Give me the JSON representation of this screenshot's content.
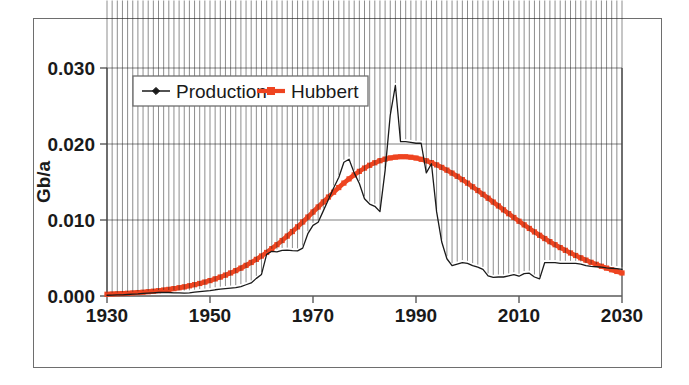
{
  "chart_data": {
    "type": "line",
    "title": "",
    "xlabel": "",
    "ylabel": "Gb/a",
    "xlim": [
      1930,
      2030
    ],
    "ylim": [
      0.0,
      0.03
    ],
    "xticks": [
      1930,
      1950,
      1970,
      1990,
      2010,
      2030
    ],
    "xtick_labels": [
      "1930",
      "1950",
      "1970",
      "1990",
      "2010",
      "2030"
    ],
    "yticks": [
      0.0,
      0.01,
      0.02,
      0.03
    ],
    "ytick_labels": [
      "0.000",
      "0.010",
      "0.020",
      "0.030"
    ],
    "grid": "horizontal",
    "legend_position": "top-left-inside",
    "series": [
      {
        "name": "Production",
        "color": "#1a1a1a",
        "marker": "diamond",
        "x": [
          1930,
          1931,
          1932,
          1933,
          1934,
          1935,
          1936,
          1937,
          1938,
          1939,
          1940,
          1941,
          1942,
          1943,
          1944,
          1945,
          1946,
          1947,
          1948,
          1949,
          1950,
          1951,
          1952,
          1953,
          1954,
          1955,
          1956,
          1957,
          1958,
          1959,
          1960,
          1961,
          1962,
          1963,
          1964,
          1965,
          1966,
          1967,
          1968,
          1969,
          1970,
          1971,
          1972,
          1973,
          1974,
          1975,
          1976,
          1977,
          1978,
          1979,
          1980,
          1981,
          1982,
          1983,
          1984,
          1985,
          1986,
          1987,
          1988,
          1989,
          1990,
          1991,
          1992,
          1993,
          1994,
          1995,
          1996,
          1997,
          1998,
          1999,
          2000,
          2001,
          2002,
          2003,
          2004,
          2005,
          2006,
          2007,
          2008,
          2009,
          2010,
          2011,
          2012,
          2013,
          2014,
          2015,
          2016,
          2017,
          2018,
          2019,
          2020,
          2021,
          2022,
          2023,
          2024,
          2025,
          2026,
          2027,
          2028,
          2029,
          2030
        ],
        "y": [
          0.0001,
          0.00012,
          0.00014,
          0.00016,
          0.0002,
          0.00024,
          0.00028,
          0.00034,
          0.00038,
          0.00042,
          0.00046,
          0.00048,
          0.00046,
          0.00042,
          0.0004,
          0.00038,
          0.00042,
          0.0005,
          0.00058,
          0.00064,
          0.0007,
          0.00082,
          0.0009,
          0.00098,
          0.00104,
          0.0011,
          0.00124,
          0.00148,
          0.00172,
          0.00232,
          0.00284,
          0.00548,
          0.00588,
          0.0058,
          0.006,
          0.00604,
          0.00598,
          0.00594,
          0.0063,
          0.0082,
          0.0093,
          0.0097,
          0.0112,
          0.0127,
          0.0142,
          0.0156,
          0.0176,
          0.018,
          0.0162,
          0.0148,
          0.0128,
          0.0121,
          0.0118,
          0.0111,
          0.0165,
          0.0238,
          0.0277,
          0.0203,
          0.0203,
          0.0202,
          0.0201,
          0.0201,
          0.0162,
          0.0174,
          0.0111,
          0.0071,
          0.0049,
          0.004,
          0.0042,
          0.0044,
          0.0043,
          0.004,
          0.0038,
          0.0035,
          0.00265,
          0.00245,
          0.0025,
          0.0025,
          0.00265,
          0.0028,
          0.0026,
          0.00295,
          0.003,
          0.0025,
          0.00225,
          0.0044,
          0.0044,
          0.0044,
          0.0043,
          0.0043,
          0.0043,
          0.0043,
          0.0042,
          0.004,
          0.0039,
          0.00385,
          0.0038,
          0.0037,
          0.00365,
          0.0036,
          0.0035
        ]
      },
      {
        "name": "Hubbert",
        "color": "#EE4420",
        "marker": "square",
        "x": [
          1930,
          1931,
          1932,
          1933,
          1934,
          1935,
          1936,
          1937,
          1938,
          1939,
          1940,
          1941,
          1942,
          1943,
          1944,
          1945,
          1946,
          1947,
          1948,
          1949,
          1950,
          1951,
          1952,
          1953,
          1954,
          1955,
          1956,
          1957,
          1958,
          1959,
          1960,
          1961,
          1962,
          1963,
          1964,
          1965,
          1966,
          1967,
          1968,
          1969,
          1970,
          1971,
          1972,
          1973,
          1974,
          1975,
          1976,
          1977,
          1978,
          1979,
          1980,
          1981,
          1982,
          1983,
          1984,
          1985,
          1986,
          1987,
          1988,
          1989,
          1990,
          1991,
          1992,
          1993,
          1994,
          1995,
          1996,
          1997,
          1998,
          1999,
          2000,
          2001,
          2002,
          2003,
          2004,
          2005,
          2006,
          2007,
          2008,
          2009,
          2010,
          2011,
          2012,
          2013,
          2014,
          2015,
          2016,
          2017,
          2018,
          2019,
          2020,
          2021,
          2022,
          2023,
          2024,
          2025,
          2026,
          2027,
          2028,
          2029,
          2030
        ],
        "y": [
          0.00023,
          0.00026,
          0.00029,
          0.00032,
          0.00036,
          0.0004,
          0.00045,
          0.0005,
          0.00056,
          0.00063,
          0.0007,
          0.00078,
          0.00087,
          0.00097,
          0.00108,
          0.0012,
          0.00134,
          0.00149,
          0.00165,
          0.00183,
          0.00203,
          0.00225,
          0.00249,
          0.00275,
          0.00303,
          0.00334,
          0.00367,
          0.00403,
          0.00441,
          0.00482,
          0.00526,
          0.00573,
          0.00623,
          0.00675,
          0.0073,
          0.00788,
          0.00848,
          0.0091,
          0.00974,
          0.01039,
          0.01105,
          0.01171,
          0.01237,
          0.01302,
          0.01366,
          0.01427,
          0.01486,
          0.01541,
          0.01593,
          0.0164,
          0.01683,
          0.0172,
          0.01753,
          0.0178,
          0.01801,
          0.01817,
          0.01827,
          0.01832,
          0.01832,
          0.01826,
          0.01815,
          0.01799,
          0.01779,
          0.01754,
          0.01725,
          0.01692,
          0.01656,
          0.01617,
          0.01575,
          0.01531,
          0.01485,
          0.01437,
          0.01388,
          0.01338,
          0.01287,
          0.01236,
          0.01185,
          0.01134,
          0.01083,
          0.01033,
          0.00984,
          0.00936,
          0.00889,
          0.00843,
          0.00799,
          0.00756,
          0.00715,
          0.00675,
          0.00637,
          0.00601,
          0.00566,
          0.00533,
          0.00502,
          0.00472,
          0.00443,
          0.00417,
          0.00391,
          0.00367,
          0.00345,
          0.00323,
          0.00303
        ]
      }
    ]
  },
  "legend": {
    "entries": [
      {
        "label": "Production"
      },
      {
        "label": "Hubbert"
      }
    ]
  }
}
